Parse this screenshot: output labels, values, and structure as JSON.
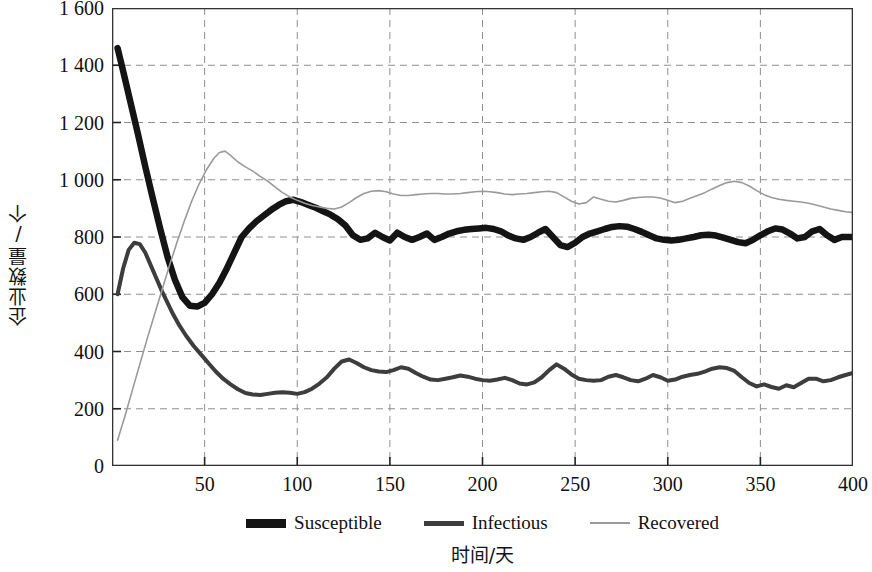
{
  "chart_data": {
    "type": "line",
    "title": "",
    "xlabel": "时间/天",
    "ylabel": "企业数量/个",
    "xlim": [
      0,
      400
    ],
    "ylim": [
      0,
      1600
    ],
    "grid": true,
    "grid_style": "dashed",
    "legend_position": "bottom",
    "x_ticks": [
      "50",
      "100",
      "150",
      "200",
      "250",
      "300",
      "350",
      "400"
    ],
    "x_tick_values": [
      50,
      100,
      150,
      200,
      250,
      300,
      350,
      400
    ],
    "y_ticks": [
      "0",
      "200",
      "400",
      "600",
      "800",
      "1 000",
      "1 200",
      "1 400",
      "1 600"
    ],
    "y_tick_values": [
      0,
      200,
      400,
      600,
      800,
      1000,
      1200,
      1400,
      1600
    ],
    "series": [
      {
        "name": "Susceptible",
        "color": "#141414",
        "width": 6.5,
        "x": [
          3,
          6,
          10,
          14,
          18,
          22,
          26,
          30,
          34,
          38,
          42,
          46,
          50,
          54,
          58,
          62,
          66,
          70,
          74,
          78,
          82,
          86,
          90,
          94,
          98,
          102,
          106,
          110,
          114,
          118,
          122,
          126,
          130,
          134,
          138,
          142,
          146,
          150,
          154,
          158,
          162,
          166,
          170,
          174,
          178,
          182,
          186,
          190,
          194,
          198,
          202,
          206,
          210,
          214,
          218,
          222,
          226,
          230,
          234,
          238,
          242,
          246,
          250,
          254,
          258,
          262,
          266,
          270,
          274,
          278,
          282,
          286,
          290,
          294,
          298,
          302,
          306,
          310,
          314,
          318,
          322,
          326,
          330,
          334,
          338,
          342,
          346,
          350,
          354,
          358,
          362,
          366,
          370,
          374,
          378,
          382,
          386,
          390,
          394,
          400
        ],
        "y": [
          1460,
          1380,
          1270,
          1160,
          1045,
          935,
          830,
          730,
          650,
          590,
          560,
          557,
          570,
          600,
          640,
          690,
          745,
          800,
          830,
          855,
          875,
          895,
          912,
          925,
          930,
          922,
          912,
          902,
          890,
          878,
          862,
          840,
          806,
          790,
          795,
          815,
          800,
          788,
          815,
          800,
          790,
          800,
          812,
          790,
          800,
          812,
          820,
          825,
          828,
          830,
          832,
          828,
          820,
          805,
          795,
          790,
          800,
          815,
          828,
          800,
          772,
          765,
          780,
          800,
          812,
          820,
          828,
          835,
          838,
          836,
          828,
          818,
          806,
          795,
          790,
          788,
          790,
          795,
          800,
          806,
          808,
          805,
          798,
          790,
          782,
          778,
          790,
          806,
          820,
          830,
          826,
          812,
          795,
          800,
          820,
          828,
          806,
          790,
          800,
          800
        ]
      },
      {
        "name": "Infectious",
        "color": "#3d3d3d",
        "width": 4.0,
        "x": [
          3,
          6,
          9,
          12,
          15,
          18,
          21,
          24,
          27,
          30,
          33,
          36,
          40,
          44,
          48,
          52,
          56,
          60,
          64,
          68,
          72,
          76,
          80,
          84,
          88,
          92,
          96,
          100,
          104,
          108,
          112,
          116,
          120,
          124,
          128,
          132,
          136,
          140,
          144,
          148,
          152,
          156,
          160,
          164,
          168,
          172,
          176,
          180,
          184,
          188,
          192,
          196,
          200,
          204,
          208,
          212,
          216,
          220,
          224,
          228,
          232,
          236,
          240,
          244,
          248,
          252,
          256,
          260,
          264,
          268,
          272,
          276,
          280,
          284,
          288,
          292,
          296,
          300,
          304,
          308,
          312,
          316,
          320,
          324,
          328,
          332,
          336,
          340,
          344,
          348,
          352,
          356,
          360,
          364,
          368,
          372,
          376,
          380,
          384,
          388,
          392,
          396,
          400
        ],
        "y": [
          600,
          690,
          755,
          780,
          775,
          745,
          700,
          655,
          610,
          570,
          530,
          495,
          455,
          420,
          390,
          360,
          330,
          305,
          285,
          268,
          255,
          250,
          248,
          252,
          256,
          258,
          256,
          252,
          258,
          270,
          288,
          310,
          340,
          365,
          372,
          360,
          345,
          335,
          330,
          328,
          335,
          345,
          340,
          325,
          312,
          302,
          300,
          305,
          310,
          316,
          312,
          305,
          300,
          298,
          302,
          308,
          300,
          288,
          285,
          292,
          310,
          335,
          355,
          340,
          320,
          305,
          300,
          298,
          300,
          312,
          318,
          310,
          300,
          296,
          305,
          318,
          310,
          298,
          302,
          312,
          318,
          322,
          330,
          340,
          345,
          342,
          332,
          310,
          290,
          278,
          285,
          276,
          270,
          282,
          275,
          290,
          305,
          305,
          296,
          300,
          310,
          318,
          325
        ]
      },
      {
        "name": "Recovered",
        "color": "#9a9a9a",
        "width": 1.6,
        "x": [
          3,
          7,
          11,
          15,
          19,
          23,
          27,
          31,
          35,
          39,
          43,
          47,
          51,
          55,
          58,
          61,
          64,
          68,
          72,
          76,
          80,
          84,
          88,
          92,
          96,
          100,
          104,
          108,
          112,
          116,
          120,
          124,
          128,
          132,
          136,
          140,
          144,
          148,
          152,
          156,
          160,
          164,
          168,
          172,
          176,
          180,
          184,
          188,
          192,
          196,
          200,
          204,
          208,
          212,
          216,
          220,
          224,
          228,
          232,
          236,
          240,
          244,
          248,
          252,
          256,
          260,
          264,
          268,
          272,
          276,
          280,
          284,
          288,
          292,
          296,
          300,
          304,
          308,
          312,
          316,
          320,
          324,
          328,
          332,
          336,
          340,
          344,
          348,
          352,
          356,
          360,
          364,
          368,
          372,
          376,
          380,
          384,
          388,
          392,
          396,
          400
        ],
        "y": [
          90,
          175,
          265,
          355,
          445,
          530,
          615,
          700,
          780,
          855,
          925,
          985,
          1035,
          1075,
          1095,
          1100,
          1085,
          1062,
          1045,
          1030,
          1012,
          995,
          975,
          955,
          940,
          928,
          918,
          910,
          905,
          900,
          898,
          905,
          920,
          938,
          952,
          960,
          962,
          958,
          950,
          945,
          945,
          948,
          950,
          952,
          952,
          950,
          950,
          952,
          955,
          958,
          960,
          958,
          955,
          950,
          948,
          950,
          952,
          955,
          958,
          960,
          955,
          940,
          925,
          915,
          920,
          940,
          932,
          925,
          922,
          928,
          935,
          938,
          940,
          940,
          936,
          928,
          920,
          925,
          935,
          945,
          955,
          968,
          980,
          990,
          995,
          990,
          978,
          962,
          948,
          938,
          932,
          928,
          925,
          922,
          918,
          912,
          905,
          898,
          893,
          888,
          885
        ]
      }
    ]
  },
  "axis": {
    "ylabel": "企业数量/个",
    "xlabel": "时间/天",
    "y_ticks": [
      "1 600",
      "1 400",
      "1 200",
      "1 000",
      "800",
      "600",
      "400",
      "200",
      "0"
    ],
    "x_ticks": [
      "50",
      "100",
      "150",
      "200",
      "250",
      "300",
      "350",
      "400"
    ]
  },
  "legend": {
    "items": [
      {
        "label": "Susceptible",
        "color": "#141414"
      },
      {
        "label": "Infectious",
        "color": "#3d3d3d"
      },
      {
        "label": "Recovered",
        "color": "#9a9a9a"
      }
    ]
  }
}
